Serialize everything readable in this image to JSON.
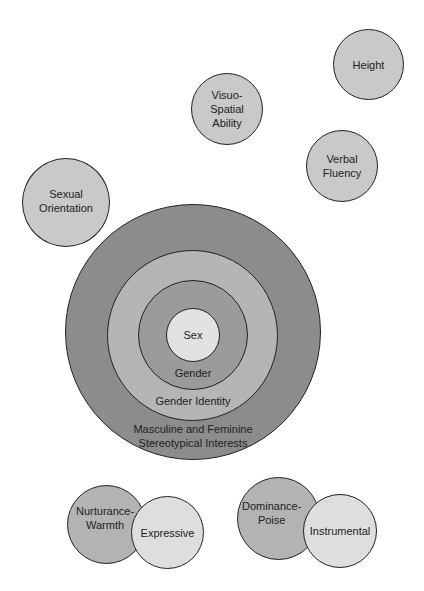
{
  "diagram": {
    "satellites": [
      {
        "id": "height",
        "label": "Height",
        "fill": "#c9c9c9"
      },
      {
        "id": "visuo-spatial",
        "label": "Visuo-\nSpatial\nAbility",
        "fill": "#c9c9c9"
      },
      {
        "id": "verbal-fluency",
        "label": "Verbal\nFluency",
        "fill": "#c9c9c9"
      },
      {
        "id": "sexual-orientation",
        "label": "Sexual\nOrientation",
        "fill": "#c9c9c9"
      }
    ],
    "concentric": [
      {
        "id": "stereotypical-interests",
        "label": "Masculine and Feminine\nStereotypical Interests",
        "fill": "#8c8c8c"
      },
      {
        "id": "gender-identity",
        "label": "Gender Identity",
        "fill": "#b5b5b5"
      },
      {
        "id": "gender",
        "label": "Gender",
        "fill": "#9b9b9b"
      },
      {
        "id": "sex",
        "label": "Sex",
        "fill": "#e2e2e2"
      }
    ],
    "pairs": [
      {
        "left": {
          "label": "Nurturance-\nWarmth",
          "fill": "#b3b3b3"
        },
        "right": {
          "label": "Expressive",
          "fill": "#dedede"
        }
      },
      {
        "left": {
          "label": "Dominance-\nPoise",
          "fill": "#b3b3b3"
        },
        "right": {
          "label": "Instrumental",
          "fill": "#dedede"
        }
      }
    ]
  }
}
